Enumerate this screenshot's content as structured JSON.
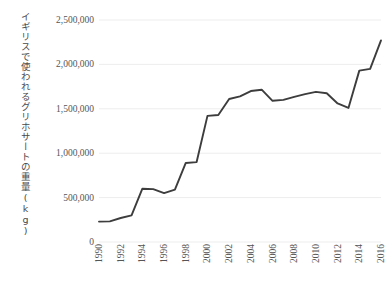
{
  "chart_data": {
    "type": "line",
    "title": "",
    "xlabel": "",
    "ylabel": "イギリスで使われるグリホサートの重量(kg)",
    "xlim": [
      1990,
      2016
    ],
    "ylim": [
      0,
      2500000
    ],
    "grid": true,
    "legend": false,
    "line_color": "#3d3d3d",
    "grid_color": "#ededed",
    "axis_text_color": "#555555",
    "y_ticks": [
      0,
      500000,
      1000000,
      1500000,
      2000000,
      2500000
    ],
    "y_tick_labels": [
      "0",
      "500,000",
      "1,000,000",
      "1,500,000",
      "2,000,000",
      "2,500,000"
    ],
    "x_ticks": [
      1990,
      1992,
      1994,
      1996,
      1998,
      2000,
      2002,
      2004,
      2006,
      2008,
      2010,
      2012,
      2014,
      2016
    ],
    "x_tick_labels": [
      "1990",
      "1992",
      "1994",
      "1996",
      "1998",
      "2000",
      "2002",
      "2004",
      "2006",
      "2008",
      "2010",
      "2012",
      "2014",
      "2016"
    ],
    "x": [
      1990,
      1991,
      1992,
      1993,
      1994,
      1995,
      1996,
      1997,
      1998,
      1999,
      2000,
      2001,
      2002,
      2003,
      2004,
      2005,
      2006,
      2007,
      2008,
      2009,
      2010,
      2011,
      2012,
      2013,
      2014,
      2015,
      2016
    ],
    "values": [
      230000,
      232000,
      270000,
      300000,
      600000,
      595000,
      550000,
      590000,
      890000,
      900000,
      1420000,
      1430000,
      1610000,
      1640000,
      1700000,
      1715000,
      1590000,
      1600000,
      1635000,
      1665000,
      1690000,
      1675000,
      1560000,
      1510000,
      1930000,
      1950000,
      2270000
    ]
  }
}
